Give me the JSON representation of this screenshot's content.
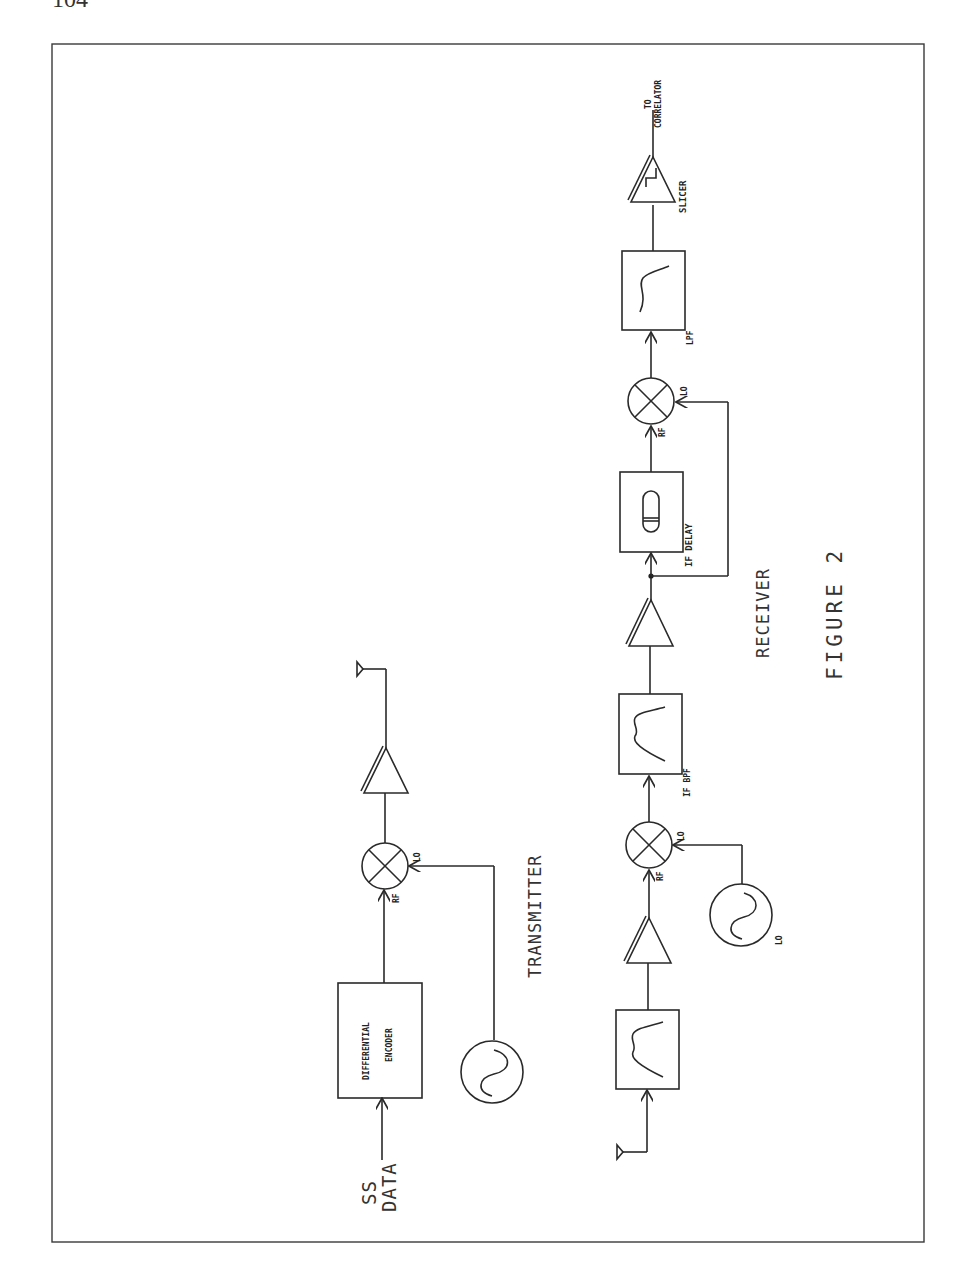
{
  "page": {
    "number": "104"
  },
  "figure": {
    "title": "FIGURE 2"
  },
  "transmitter": {
    "label": "TRANSMITTER",
    "input_label_line1": "SS",
    "input_label_line2": "DATA",
    "encoder_line1": "DIFFERENTIAL",
    "encoder_line2": "ENCODER",
    "mixer_rf": "RF",
    "mixer_lo": "LO"
  },
  "receiver": {
    "label": "RECEIVER",
    "mixer1_rf": "RF",
    "mixer1_lo": "LO",
    "oscillator_label": "LO",
    "if_bpf_label": "IF BPF",
    "if_delay_label": "IF DELAY",
    "mixer2_rf": "RF",
    "mixer2_lo": "LO",
    "lpf_label": "LPF",
    "slicer_label": "SLICER",
    "output_line1": "TO",
    "output_line2": "CORRELATOR"
  }
}
